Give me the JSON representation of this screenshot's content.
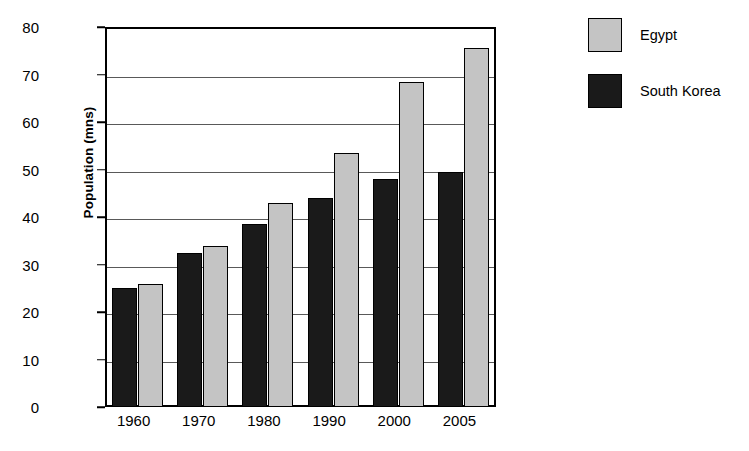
{
  "chart_data": {
    "type": "bar",
    "title": "",
    "subtitle": "",
    "xlabel": "",
    "ylabel": "Population (mns)",
    "categories": [
      "1960",
      "1970",
      "1980",
      "1990",
      "2000",
      "2005"
    ],
    "series": [
      {
        "name": "South Korea",
        "color": "#1a1a1a",
        "values": [
          25,
          32.5,
          38.5,
          44,
          48,
          49.5
        ]
      },
      {
        "name": "Egypt",
        "color": "#c4c4c4",
        "values": [
          26,
          34,
          43,
          53.5,
          68.5,
          75.5
        ]
      }
    ],
    "series_draw_order": [
      "South Korea",
      "Egypt"
    ],
    "ylim": [
      0,
      80
    ],
    "ytick_step": 10,
    "yticks": [
      "80",
      "70",
      "60",
      "50",
      "40",
      "30",
      "20",
      "10",
      "0"
    ],
    "grid": true,
    "grid_axis": "y",
    "legend_position": "right",
    "legend": [
      {
        "label": "Egypt",
        "swatch": "light-gray-square"
      },
      {
        "label": "South Korea",
        "swatch": "black-square"
      }
    ]
  }
}
